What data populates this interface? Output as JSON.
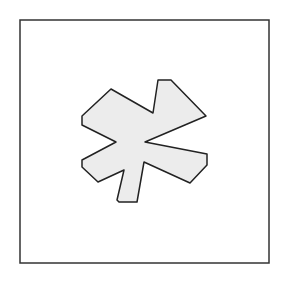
{
  "diagram": {
    "frame": {
      "x": 20,
      "y": 20,
      "width": 249,
      "height": 243,
      "stroke": "#333333"
    },
    "shape": {
      "name": "irregular-star-polygon",
      "fill": "#ececec",
      "stroke": "#222222",
      "points": "111,89 153,113 158,80 171,80 206,116 145,142 207,154 207,165 190,183 144,162 137,202 119,202 117,200 124,170 98,182 82,167 82,160 116,142 82,125 82,116"
    }
  }
}
